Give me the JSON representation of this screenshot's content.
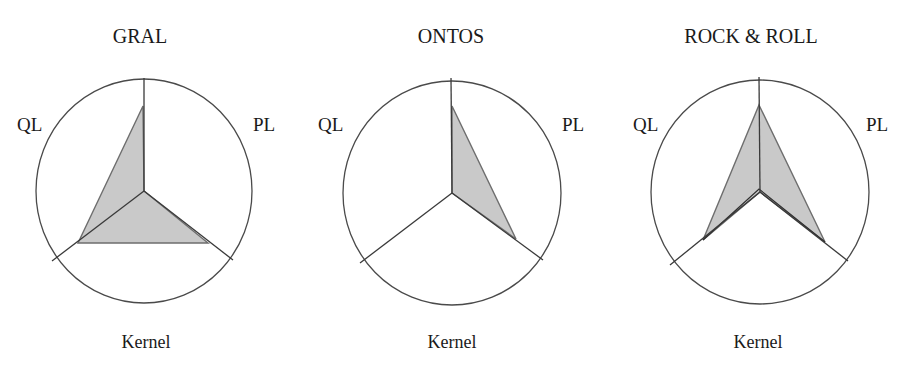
{
  "chart_data": [
    {
      "type": "radar",
      "title": "GRAL",
      "axes": [
        "PL",
        "Kernel",
        "QL"
      ],
      "axis_labels": {
        "top_left": "QL",
        "top_right": "PL",
        "bottom": "Kernel"
      },
      "values_normalized": {
        "top": 0.76,
        "PL": 0.73,
        "QL": 0.75,
        "inner": 0.0
      },
      "geometry": {
        "center": [
          144,
          191
        ],
        "rx": 108,
        "ry": 112,
        "axis_top": [
          144,
          78
        ],
        "axis_pl": [
          233,
          260
        ],
        "axis_ql": [
          52,
          261
        ],
        "polygon": [
          [
            143,
            106
          ],
          [
            144,
            191
          ],
          [
            208,
            243
          ],
          [
            78,
            243
          ]
        ],
        "second_series": []
      },
      "label_pos": {
        "title": [
          140,
          43
        ],
        "ql": [
          17,
          131
        ],
        "pl": [
          253,
          131
        ],
        "kernel": [
          146,
          348
        ]
      }
    },
    {
      "type": "radar",
      "title": "ONTOS",
      "axes": [
        "PL",
        "Kernel",
        "QL"
      ],
      "axis_labels": {
        "top_left": "QL",
        "top_right": "PL",
        "bottom": "Kernel"
      },
      "values_normalized": {
        "top": 0.75,
        "PL": 0.73,
        "QL": 0.0
      },
      "geometry": {
        "center": [
          452,
          193
        ],
        "rx": 109,
        "ry": 112,
        "axis_top": [
          451,
          78
        ],
        "axis_pl": [
          543,
          260
        ],
        "axis_ql": [
          360,
          263
        ],
        "polygon": [
          [
            452,
            106
          ],
          [
            516,
            239
          ],
          [
            452,
            193
          ]
        ],
        "second_series": []
      },
      "label_pos": {
        "title": [
          451,
          43
        ],
        "ql": [
          318,
          131
        ],
        "pl": [
          562,
          131
        ],
        "kernel": [
          452,
          348
        ]
      }
    },
    {
      "type": "radar",
      "title": "ROCK & ROLL",
      "axes": [
        "PL",
        "Kernel",
        "QL"
      ],
      "axis_labels": {
        "top_left": "QL",
        "top_right": "PL",
        "bottom": "Kernel"
      },
      "values_normalized": {
        "top": 0.77,
        "PL": 0.73,
        "QL": 0.72,
        "inner": 0.0
      },
      "geometry": {
        "center": [
          760,
          192
        ],
        "rx": 109,
        "ry": 112,
        "axis_top": [
          759,
          77
        ],
        "axis_pl": [
          848,
          261
        ],
        "axis_ql": [
          670,
          265
        ],
        "polygon": [
          [
            759,
            105
          ],
          [
            825,
            242
          ],
          [
            760,
            192
          ],
          [
            703,
            240
          ]
        ],
        "second_series": [
          [
            703,
            240
          ],
          [
            759,
            189
          ],
          [
            825,
            242
          ]
        ]
      },
      "label_pos": {
        "title": [
          751,
          43
        ],
        "ql": [
          633,
          131
        ],
        "pl": [
          866,
          131
        ],
        "kernel": [
          758,
          348
        ]
      }
    }
  ],
  "figure": {
    "width": 903,
    "height": 368,
    "colors": {
      "fill": "#c9c9c9",
      "line": "#4a4a4a",
      "text": "#1a1a1a",
      "background": "#ffffff"
    }
  }
}
